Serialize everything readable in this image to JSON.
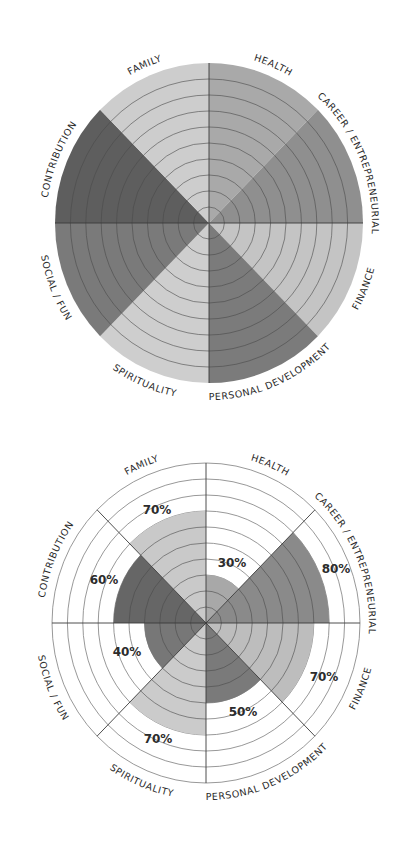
{
  "chart_data": [
    {
      "type": "pie",
      "subtype": "wheel-of-life-template",
      "title": "",
      "rings": 10,
      "categories": [
        "HEALTH",
        "CAREER / ENTREPRENEURIAL",
        "FINANCE",
        "PERSONAL DEVELOPMENT",
        "SPIRITUALITY",
        "SOCIAL / FUN",
        "CONTRIBUTION",
        "FAMILY"
      ],
      "values": [
        100,
        100,
        100,
        100,
        100,
        100,
        100,
        100
      ],
      "colors": [
        "#a9a9a9",
        "#8f8f8f",
        "#c4c4c4",
        "#7b7b7b",
        "#cecece",
        "#7a7a7a",
        "#5e5e5e",
        "#cdcdcd"
      ],
      "legend": "none",
      "geometry": {
        "cx": 209,
        "cy": 223,
        "rx": 154,
        "ry": 160
      }
    },
    {
      "type": "pie",
      "subtype": "wheel-of-life-filled",
      "title": "",
      "rings": 10,
      "categories": [
        "HEALTH",
        "CAREER / ENTREPRENEURIAL",
        "FINANCE",
        "PERSONAL DEVELOPMENT",
        "SPIRITUALITY",
        "SOCIAL / FUN",
        "CONTRIBUTION",
        "FAMILY"
      ],
      "values": [
        30,
        80,
        70,
        50,
        70,
        40,
        60,
        70
      ],
      "value_labels": [
        "30%",
        "80%",
        "70%",
        "50%",
        "70%",
        "40%",
        "60%",
        "70%"
      ],
      "label_positions": [
        [
          232,
          563
        ],
        [
          336,
          569
        ],
        [
          324,
          677
        ],
        [
          243,
          712
        ],
        [
          158,
          739
        ],
        [
          127,
          652
        ],
        [
          104,
          580
        ],
        [
          157,
          510
        ]
      ],
      "colors": [
        "#a8a8a8",
        "#8a8a8a",
        "#bdbdbd",
        "#7a7a7a",
        "#cbcbcb",
        "#777777",
        "#666666",
        "#c9c9c9"
      ],
      "ylim": [
        0,
        100
      ],
      "legend": "none",
      "geometry": {
        "cx": 206,
        "cy": 623,
        "rx": 154,
        "ry": 160
      }
    }
  ],
  "wheels": {
    "top": {
      "name": "blank-wheel-of-life"
    },
    "bottom": {
      "name": "scored-wheel-of-life"
    }
  }
}
